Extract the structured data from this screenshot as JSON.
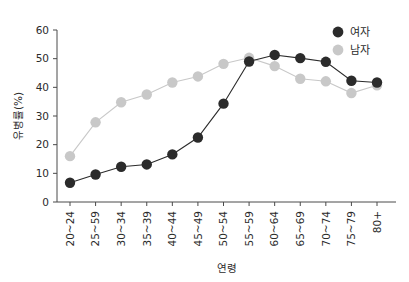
{
  "chart_data": {
    "type": "line",
    "title": "",
    "xlabel": "연령",
    "ylabel": "유병률(%)",
    "categories": [
      "20~24",
      "25~59",
      "30~34",
      "35~39",
      "40~44",
      "45~49",
      "50~54",
      "55~59",
      "60~64",
      "65~69",
      "70~74",
      "75~79",
      "80+"
    ],
    "series": [
      {
        "name": "여자",
        "color": "#2b2b2b",
        "values": [
          6.7,
          9.6,
          12.3,
          13.1,
          16.6,
          22.5,
          34.3,
          49.0,
          51.3,
          50.2,
          48.9,
          42.3,
          41.7
        ]
      },
      {
        "name": "남자",
        "color": "#c8c8c8",
        "values": [
          16.0,
          27.8,
          34.8,
          37.5,
          41.7,
          43.8,
          48.2,
          50.3,
          47.4,
          43.0,
          42.1,
          38.0,
          40.7
        ]
      }
    ],
    "ylim": [
      0,
      60
    ],
    "yticks": [
      0,
      10,
      20,
      30,
      40,
      50,
      60
    ],
    "ytick_labels": [
      "0",
      "10",
      "20",
      "30",
      "40",
      "50",
      "60"
    ],
    "grid": false,
    "legend_position": "top-right"
  },
  "legend": {
    "items": [
      {
        "label": "여자",
        "color": "#2b2b2b"
      },
      {
        "label": "남자",
        "color": "#c8c8c8"
      }
    ]
  },
  "axes": {
    "y_title": "유병률(%)",
    "x_title": "연령"
  }
}
